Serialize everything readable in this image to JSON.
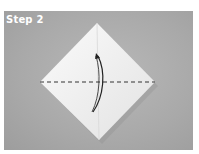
{
  "title": "Step 2",
  "colors": {
    "background": "#a8a8a8",
    "paper_light": "#f4f4f4",
    "paper_shadow": "#dcdcdc",
    "line": "#333333"
  },
  "figure": {
    "shape": "diamond-square",
    "fold_line": "dashed-horizontal",
    "arrow": "curved-up-down"
  }
}
